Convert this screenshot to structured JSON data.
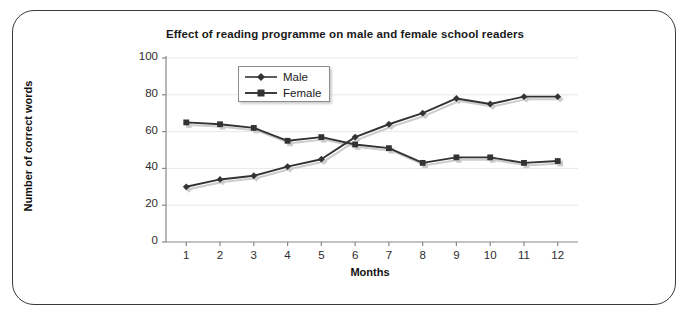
{
  "chart_data": {
    "type": "line",
    "title": "Effect of reading programme on male and female school readers",
    "xlabel": "Months",
    "ylabel": "Number of correct words",
    "categories": [
      "1",
      "2",
      "3",
      "4",
      "5",
      "6",
      "7",
      "8",
      "9",
      "10",
      "11",
      "12"
    ],
    "x": [
      1,
      2,
      3,
      4,
      5,
      6,
      7,
      8,
      9,
      10,
      11,
      12
    ],
    "series": [
      {
        "name": "Male",
        "marker": "diamond",
        "color": "#333333",
        "values": [
          30,
          34,
          36,
          41,
          45,
          57,
          64,
          70,
          78,
          75,
          79,
          79
        ]
      },
      {
        "name": "Female",
        "marker": "square",
        "color": "#333333",
        "values": [
          65,
          64,
          62,
          55,
          57,
          53,
          51,
          43,
          46,
          46,
          43,
          44
        ]
      }
    ],
    "ylim": [
      0,
      100
    ],
    "ytick_labels": [
      "0",
      "20",
      "40",
      "60",
      "80",
      "100"
    ],
    "ytick_values": [
      0,
      20,
      40,
      60,
      80,
      100
    ],
    "xlim": [
      0.4,
      12.6
    ],
    "grid": "horizontal",
    "legend_position": "top-center",
    "legend_entries": [
      "Male",
      "Female"
    ]
  },
  "colors": {
    "frame_border": "#3a3a3a",
    "gridline": "#e8e8e8",
    "axis": "#888888",
    "line": "#333333",
    "shadow": "#cccccc",
    "background": "#ffffff"
  }
}
